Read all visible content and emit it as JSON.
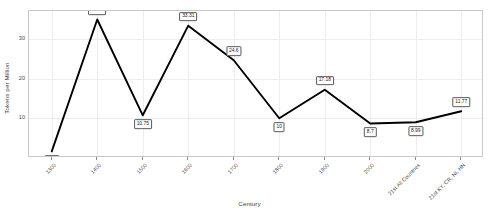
{
  "chart_data": {
    "type": "line",
    "title": "",
    "xlabel": "Century",
    "ylabel": "Tokens per Million",
    "categories": [
      "1300",
      "1400",
      "1500",
      "1600",
      "1700",
      "1800",
      "1900",
      "2000",
      "21st All Countries",
      "21st KY, CR, NI, HN"
    ],
    "values": [
      1.68,
      34.86,
      10.75,
      33.31,
      24.6,
      10,
      17.18,
      8.7,
      8.99,
      11.77
    ],
    "point_labels": [
      "1.68",
      "34.86",
      "10.75",
      "33.31",
      "24.6",
      "10",
      "17.18",
      "8.7",
      "8.99",
      "11.77"
    ],
    "yticks": [
      10,
      20,
      30
    ],
    "ytick_labels": [
      "10",
      "20",
      "30"
    ],
    "ylim": [
      0,
      37
    ],
    "grid": true,
    "legend": "none",
    "line_color": "#000000",
    "grid_color": "#ededed",
    "frame_color": "#c9c9c9"
  }
}
